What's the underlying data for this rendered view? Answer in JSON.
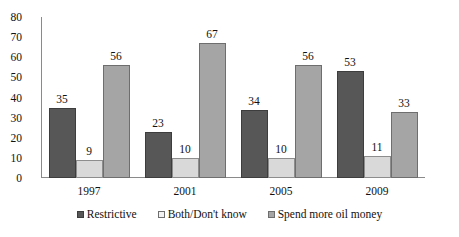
{
  "chart_data": {
    "type": "bar",
    "title": "",
    "subtitle": "",
    "xlabel": "",
    "ylabel": "",
    "categories": [
      "1997",
      "2001",
      "2005",
      "2009"
    ],
    "series": [
      {
        "name": "Restrictive",
        "values": [
          35,
          23,
          34,
          53
        ],
        "color": "#575757"
      },
      {
        "name": "Both/Don't know",
        "values": [
          9,
          10,
          10,
          11
        ],
        "color": "#d9d9d9"
      },
      {
        "name": "Spend more oil money",
        "values": [
          56,
          67,
          56,
          33
        ],
        "color": "#a5a5a5"
      }
    ],
    "ylim": [
      0,
      80
    ],
    "yticks": [
      80,
      70,
      60,
      50,
      40,
      30,
      20,
      10,
      0
    ],
    "ytick_labels": [
      "80",
      "70",
      "60",
      "50",
      "40",
      "30",
      "20",
      "10",
      "0"
    ],
    "grid": false,
    "legend_position": "bottom",
    "data_labels": true,
    "annotations": []
  },
  "legend": {
    "items": [
      {
        "label": "Restrictive"
      },
      {
        "label": "Both/Don't know"
      },
      {
        "label": "Spend more oil money"
      }
    ]
  }
}
